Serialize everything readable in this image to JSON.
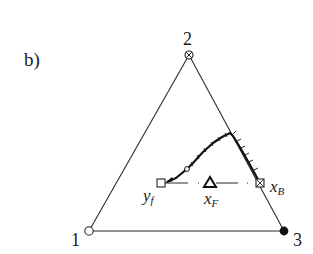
{
  "panel_label": "b)",
  "diagram": {
    "type": "ternary-composition-diagram",
    "vertices": [
      {
        "id": "1",
        "label": "1",
        "marker": "open-circle"
      },
      {
        "id": "2",
        "label": "2",
        "marker": "circle-cross"
      },
      {
        "id": "3",
        "label": "3",
        "marker": "filled-circle"
      }
    ],
    "points": [
      {
        "id": "yf",
        "label": "y",
        "subscript": "f",
        "marker": "open-square"
      },
      {
        "id": "xF",
        "label": "x",
        "subscript": "F",
        "marker": "open-triangle"
      },
      {
        "id": "xB",
        "label": "x",
        "subscript": "B",
        "marker": "square-cross"
      }
    ],
    "curve": {
      "description": "residue curve trajectory from x_B up to a maximum then down toward y_f, with tick marks",
      "end_marker": "arrow",
      "intermediate_marker": "open-circle"
    },
    "balance_line": {
      "from": "yf",
      "through": "xF",
      "to": "xB",
      "style": "dash-dot"
    }
  }
}
